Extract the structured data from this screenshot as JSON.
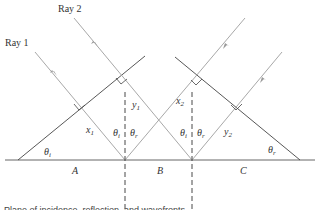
{
  "diagram": {
    "labels": {
      "ray1": "Ray 1",
      "ray2": "Ray 2",
      "x1": "x",
      "x1_sub": "1",
      "y1": "y",
      "y1_sub": "1",
      "x2": "x",
      "x2_sub": "2",
      "y2": "y",
      "y2_sub": "2",
      "theta": "θ",
      "theta_i_sub": "i",
      "theta_r_sub": "r",
      "region_a": "A",
      "region_b": "B",
      "region_c": "C"
    },
    "colors": {
      "ray": "#a8a8a8",
      "wavefront": "#444444",
      "surface": "#666666",
      "normal": "#333333"
    },
    "caption_fragment": "Plane of incidence, reflection, and wavefronts"
  }
}
